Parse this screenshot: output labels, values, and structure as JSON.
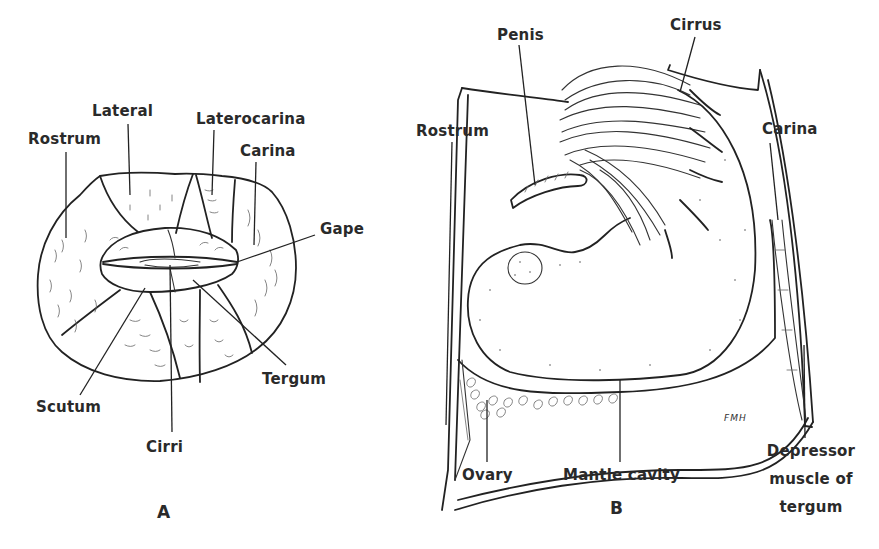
{
  "figure": {
    "panels": [
      {
        "id": "A",
        "label": "A",
        "labels": {
          "rostrum": "Rostrum",
          "lateral": "Lateral",
          "laterocarina": "Laterocarina",
          "carina": "Carina",
          "gape": "Gape",
          "tergum": "Tergum",
          "scutum": "Scutum",
          "cirri": "Cirri"
        }
      },
      {
        "id": "B",
        "label": "B",
        "labels": {
          "penis": "Penis",
          "cirrus": "Cirrus",
          "rostrum": "Rostrum",
          "carina": "Carina",
          "ovary": "Ovary",
          "mantle_cavity": "Mantle cavity",
          "depressor_line1": "Depressor",
          "depressor_line2": "muscle of",
          "depressor_line3": "tergum"
        },
        "artist_signature": "FMH"
      }
    ]
  }
}
